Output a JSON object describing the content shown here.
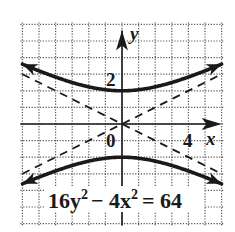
{
  "chart_data": {
    "type": "line",
    "title": "",
    "equation": "16y^2 - 4x^2 = 64",
    "equation_parts": {
      "a": "16y",
      "a_exp": "2",
      "minus": "− 4x",
      "b_exp": "2",
      "rhs": "= 64"
    },
    "xlabel": "x",
    "ylabel": "y",
    "xlim": [
      -6,
      6
    ],
    "ylim": [
      -6,
      6
    ],
    "grid": true,
    "grid_step": 1,
    "tick_labels": {
      "origin": "0",
      "x": [
        {
          "value": 4,
          "label": "4"
        }
      ],
      "y": [
        {
          "value": 2,
          "label": "2"
        }
      ]
    },
    "series": [
      {
        "name": "upper branch",
        "style": "solid-thick",
        "formula": "y = sqrt(4 + x^2/4)",
        "vertex": [
          0,
          2
        ],
        "x": [
          -6,
          -4,
          -2,
          0,
          2,
          4,
          6
        ],
        "values": [
          3.61,
          2.83,
          2.24,
          2.0,
          2.24,
          2.83,
          3.61
        ]
      },
      {
        "name": "lower branch",
        "style": "solid-thick",
        "formula": "y = -sqrt(4 + x^2/4)",
        "vertex": [
          0,
          -2
        ],
        "x": [
          -6,
          -4,
          -2,
          0,
          2,
          4,
          6
        ],
        "values": [
          -3.61,
          -2.83,
          -2.24,
          -2.0,
          -2.24,
          -2.83,
          -3.61
        ]
      },
      {
        "name": "asymptote y = x/2",
        "style": "dashed",
        "x": [
          -6,
          6
        ],
        "values": [
          -3,
          3
        ]
      },
      {
        "name": "asymptote y = -x/2",
        "style": "dashed",
        "x": [
          -6,
          6
        ],
        "values": [
          3,
          -3
        ]
      }
    ],
    "colors": {
      "curve": "#1a1a1a",
      "grid": "#555555",
      "axis": "#1a1a1a",
      "background": "#ffffff"
    }
  }
}
